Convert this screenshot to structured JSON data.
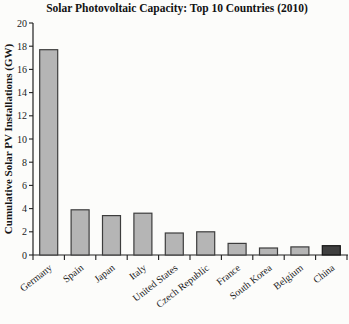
{
  "chart_data": {
    "type": "bar",
    "title": "Solar Photovoltaic Capacity: Top 10 Countries (2010)",
    "xlabel": "",
    "ylabel": "Cumulative Solar PV Installations (GW)",
    "categories": [
      "Germany",
      "Spain",
      "Japan",
      "Italy",
      "United States",
      "Czech Republic",
      "France",
      "South Korea",
      "Belgium",
      "China"
    ],
    "values": [
      17.7,
      3.9,
      3.4,
      3.6,
      1.9,
      2.0,
      1.0,
      0.6,
      0.7,
      0.8
    ],
    "ylim": [
      0,
      20
    ],
    "ytick_step": 2,
    "yticks": [
      0,
      2,
      4,
      6,
      8,
      10,
      12,
      14,
      16,
      18,
      20
    ],
    "grid": false,
    "legend": "none",
    "bar_color": "#b5b5b5",
    "bar_border": "#3d3d3d",
    "highlight_country": "China",
    "highlight_index": 9,
    "highlight_color": "#3f3f3f",
    "highlight_border": "#151515",
    "axis_color": "#1f1f1f",
    "background_color": "#fcfcfa"
  }
}
